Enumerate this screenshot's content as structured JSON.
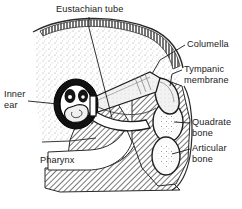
{
  "figure": {
    "background_color": "#ffffff",
    "ink_color": "#1a1a1a"
  },
  "labels": {
    "eustachian_tube": "Eustachian tube",
    "columella": "Columella",
    "tympanic_membrane": "Tympanic\nmembrane",
    "quadrate_bone": "Quadrate\nbone",
    "articular_bone": "Articular\nbone",
    "inner_ear": "Inner\near",
    "pharynx": "Pharynx"
  },
  "structures": [
    {
      "name": "skull-outline",
      "label": "Skull outline"
    },
    {
      "name": "inner-ear-cochlea",
      "label": "Inner ear"
    },
    {
      "name": "eustachian-tube-canal",
      "label": "Eustachian tube"
    },
    {
      "name": "columella-bone",
      "label": "Columella"
    },
    {
      "name": "tympanic-membrane-surface",
      "label": "Tympanic membrane"
    },
    {
      "name": "quadrate-bone-body",
      "label": "Quadrate bone"
    },
    {
      "name": "articular-bone-body",
      "label": "Articular bone"
    },
    {
      "name": "pharynx-cavity",
      "label": "Pharynx"
    },
    {
      "name": "lower-jaw-tissue",
      "label": "Lower jaw tissue"
    }
  ]
}
